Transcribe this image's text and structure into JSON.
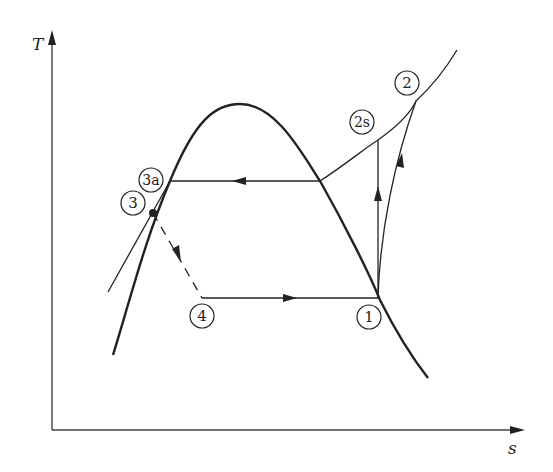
{
  "diagram": {
    "type": "T-s diagram (vapor-compression refrigeration cycle)",
    "axes": {
      "y_label": "T",
      "x_label": "s"
    },
    "states": [
      {
        "id": "1",
        "label": "1"
      },
      {
        "id": "2",
        "label": "2"
      },
      {
        "id": "2s",
        "label": "2s"
      },
      {
        "id": "3",
        "label": "3"
      },
      {
        "id": "3a",
        "label": "3a"
      },
      {
        "id": "4",
        "label": "4"
      }
    ],
    "processes": [
      {
        "from": "1",
        "to": "2s",
        "style": "solid",
        "note": "isentropic compression"
      },
      {
        "from": "1",
        "to": "2",
        "style": "solid",
        "note": "actual compression"
      },
      {
        "from": "2",
        "to": "3a",
        "style": "solid",
        "note": "condensation along constant-pressure line"
      },
      {
        "from": "3",
        "to": "4",
        "style": "dashed",
        "note": "throttling"
      },
      {
        "from": "4",
        "to": "1",
        "style": "solid",
        "note": "evaporation"
      }
    ],
    "colors": {
      "ink": "#222222",
      "background": "#ffffff"
    }
  }
}
